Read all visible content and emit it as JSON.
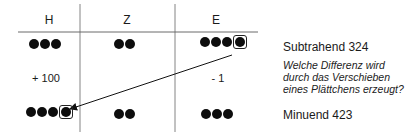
{
  "table": {
    "columns": [
      "H",
      "Z",
      "E"
    ],
    "subtrahend_row": {
      "H": 3,
      "Z": 2,
      "E": 4,
      "highlighted_column": "E"
    },
    "change_row": {
      "H": "+ 100",
      "Z": "",
      "E": "- 1"
    },
    "minuend_row": {
      "H": 4,
      "Z": 2,
      "E": 3,
      "highlighted_column": "H"
    }
  },
  "labels": {
    "subtrahend": "Subtrahend 324",
    "minuend": "Minuend 423",
    "question_lines": [
      "Welche Differenz wird",
      "durch das Verschieben",
      "eines Plättchens erzeugt?"
    ]
  },
  "arrow": {
    "from": "E-subtrahend",
    "to": "H-minuend"
  }
}
